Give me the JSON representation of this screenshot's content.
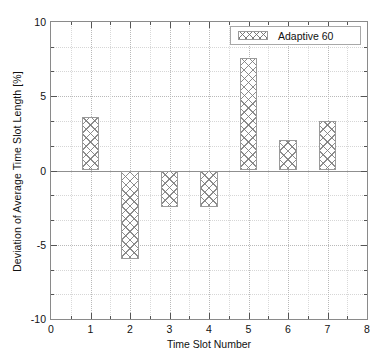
{
  "chart_data": {
    "type": "bar",
    "title": "",
    "xlabel": "Time Slot Number",
    "ylabel": "Deviation of Average Time Slot Length [%]",
    "categories": [
      1,
      2,
      3,
      4,
      5,
      6,
      7
    ],
    "values": [
      3.6,
      -5.95,
      -2.45,
      -2.45,
      7.6,
      2.05,
      3.3
    ],
    "series": [
      {
        "name": "Adaptive 60",
        "values": [
          3.6,
          -5.95,
          -2.45,
          -2.45,
          7.6,
          2.05,
          3.3
        ]
      }
    ],
    "xlim": [
      0,
      8
    ],
    "ylim": [
      -10,
      10
    ],
    "x_major_ticks": [
      0,
      1,
      2,
      3,
      4,
      5,
      6,
      7,
      8
    ],
    "x_minor_ticks": [
      0.5,
      1.5,
      2.5,
      3.5,
      4.5,
      5.5,
      6.5,
      7.5
    ],
    "x_tick_labels": [
      "0",
      "1",
      "2",
      "3",
      "4",
      "5",
      "6",
      "7",
      "8"
    ],
    "y_major_ticks": [
      -10,
      -5,
      0,
      5,
      10
    ],
    "y_minor_ticks": [
      -8.333,
      -6.667,
      -3.333,
      -1.667,
      1.667,
      3.333,
      6.667,
      8.333
    ],
    "y_tick_labels": [
      "-10",
      "-5",
      "0",
      "5",
      "10"
    ],
    "grid": true,
    "legend_position": "top-right",
    "bar_width": 0.45,
    "bar_fill": "cross-hatch",
    "colors": {
      "hatch": "#787878",
      "bar_edge": "#9a9a9a",
      "grid_major": "#b9b9b9",
      "grid_minor": "#d9d9d9",
      "axis": "#8a8a8a",
      "text": "#111111",
      "background": "#ffffff"
    }
  },
  "legend": {
    "entries": [
      {
        "label": "Adaptive 60",
        "swatch": "cross-hatch-swatch"
      }
    ]
  }
}
